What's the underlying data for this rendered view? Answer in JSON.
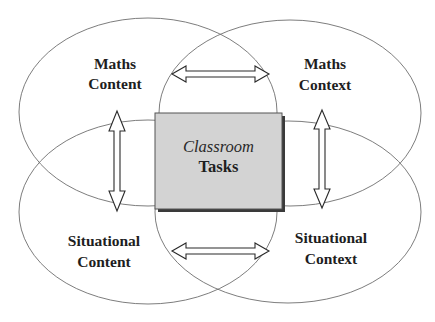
{
  "diagram": {
    "type": "four-overlapping-ellipses-with-central-box",
    "regions": [
      {
        "id": "maths-content",
        "line1": "Maths",
        "line2": "Content",
        "quadrant": "top-left"
      },
      {
        "id": "maths-context",
        "line1": "Maths",
        "line2": "Context",
        "quadrant": "top-right"
      },
      {
        "id": "situational-content",
        "line1": "Situational",
        "line2": "Content",
        "quadrant": "bottom-left"
      },
      {
        "id": "situational-context",
        "line1": "Situational",
        "line2": "Context",
        "quadrant": "bottom-right"
      }
    ],
    "center": {
      "line1": "Classroom",
      "line2": "Tasks"
    },
    "connections": [
      {
        "from": "maths-content",
        "to": "maths-context",
        "direction": "bidirectional"
      },
      {
        "from": "maths-content",
        "to": "situational-content",
        "direction": "bidirectional"
      },
      {
        "from": "maths-context",
        "to": "situational-context",
        "direction": "bidirectional"
      },
      {
        "from": "situational-content",
        "to": "situational-context",
        "direction": "bidirectional"
      }
    ],
    "colors": {
      "box_fill": "#d3d3d3",
      "ellipse_stroke": "#6e6e6e",
      "arrow_stroke": "#2a2a2a",
      "text": "#1e1e1e"
    }
  }
}
